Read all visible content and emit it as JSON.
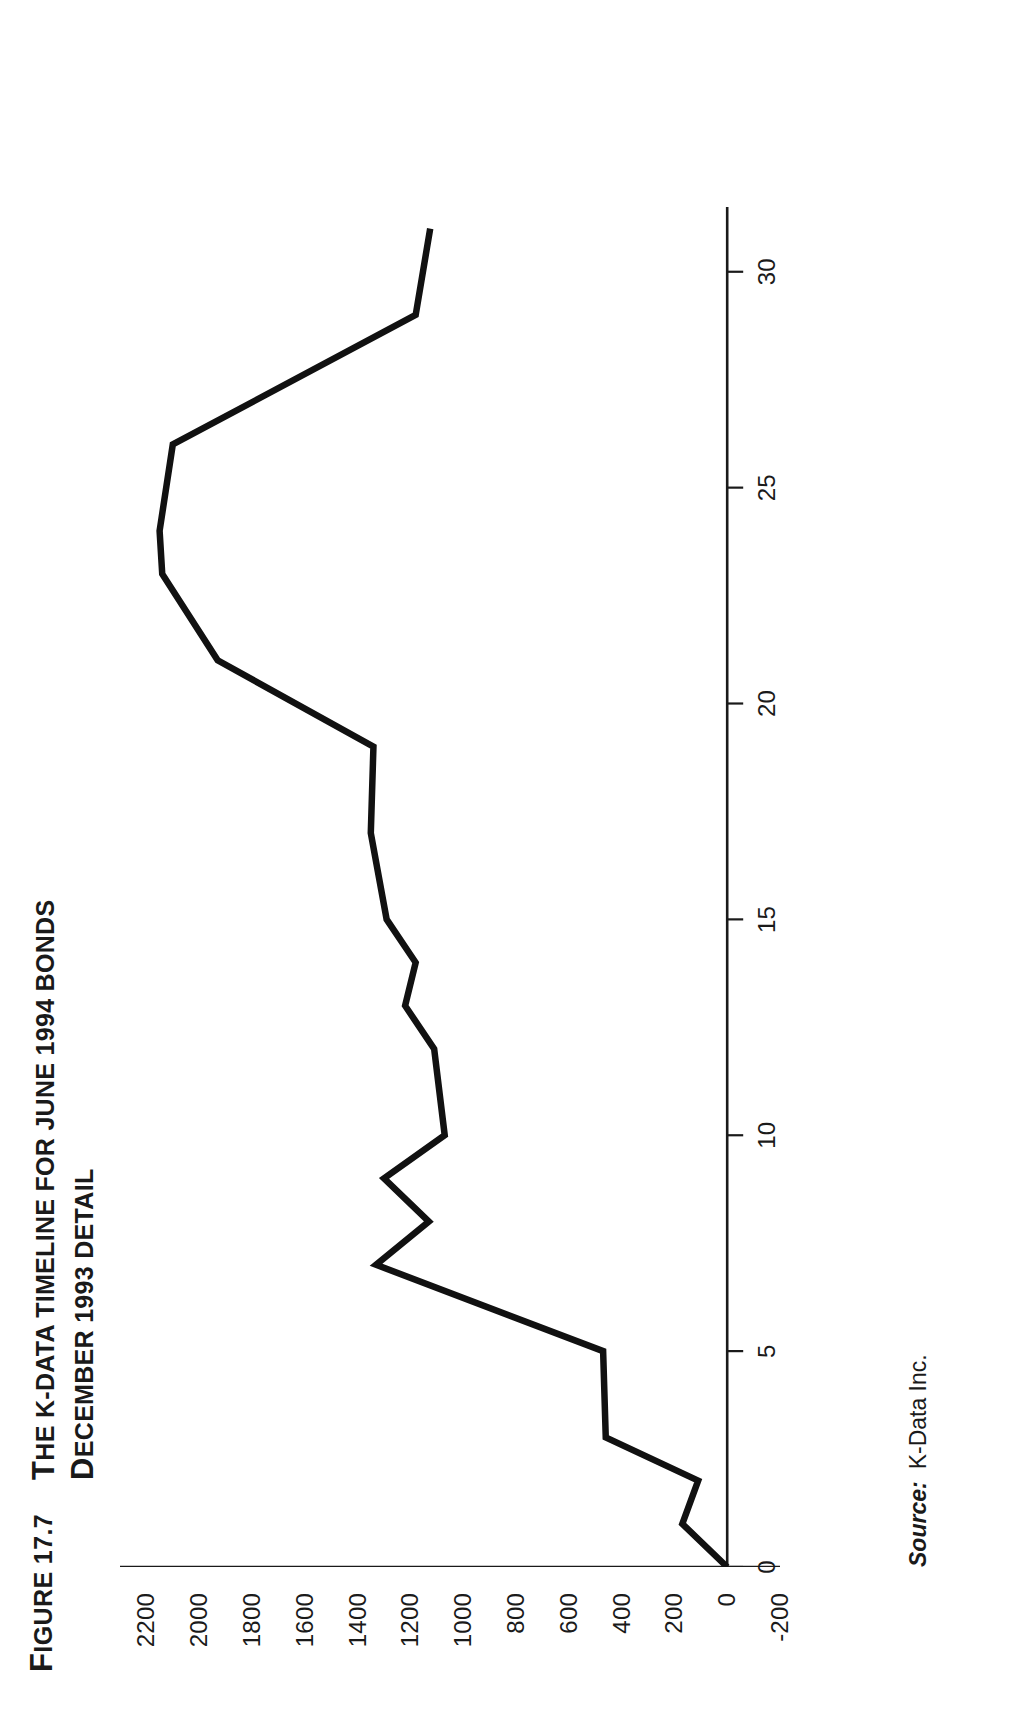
{
  "figure": {
    "number_label": "FIGURE 17.7",
    "number_lead_cap": "F",
    "number_rest": "IGURE 17.7",
    "title_line1_cap": "T",
    "title_line1_rest": "HE K-DATA TIMELINE FOR JUNE 1994 BONDS",
    "title_line2_cap": "D",
    "title_line2_rest": "ECEMBER 1993 DETAIL",
    "title_full": "THE K-DATA TIMELINE FOR JUNE 1994 BONDS DECEMBER 1993 DETAIL",
    "orientation": "rotated-90-ccw"
  },
  "source": {
    "label": "Source:",
    "value": "K-Data Inc."
  },
  "chart_data": {
    "type": "line",
    "title": "THE K-DATA TIMELINE FOR JUNE 1994 BONDS DECEMBER 1993 DETAIL",
    "subtitle": "",
    "xlabel": "",
    "ylabel": "",
    "xlim": [
      0,
      31.5
    ],
    "ylim": [
      -200,
      2300
    ],
    "xticks": [
      0,
      5,
      10,
      15,
      20,
      25,
      30
    ],
    "xtick_labels": [
      "0",
      "5",
      "10",
      "15",
      "20",
      "25",
      "30"
    ],
    "yticks": [
      -200,
      0,
      200,
      400,
      600,
      800,
      1000,
      1200,
      1400,
      1600,
      1800,
      2000,
      2200
    ],
    "ytick_labels": [
      "-200",
      "0",
      "200",
      "400",
      "600",
      "800",
      "1000",
      "1200",
      "1400",
      "1600",
      "1800",
      "2000",
      "2200"
    ],
    "grid": false,
    "legend": false,
    "series": [
      {
        "name": "K-Data timeline",
        "color": "#111111",
        "x": [
          0,
          1,
          2,
          3,
          5,
          7,
          8,
          9,
          10,
          12,
          13,
          14,
          15,
          17,
          19,
          21,
          23,
          24,
          26,
          29,
          31
        ],
        "values": [
          0,
          170,
          110,
          460,
          470,
          1330,
          1130,
          1300,
          1070,
          1110,
          1220,
          1180,
          1290,
          1350,
          1340,
          1930,
          2140,
          2150,
          2100,
          1180,
          1125
        ]
      }
    ]
  },
  "axes": {
    "x_axis_name": "day-of-month-axis",
    "y_axis_name": "value-axis"
  }
}
